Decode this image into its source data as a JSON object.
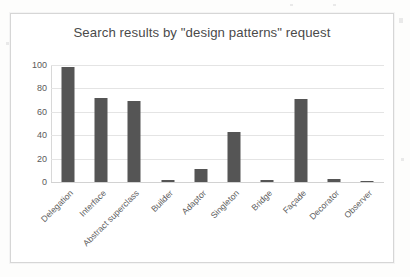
{
  "chart_data": {
    "type": "bar",
    "title": "Search results by \"design patterns\" request",
    "xlabel": "",
    "ylabel": "",
    "ylim": [
      0,
      100
    ],
    "yticks": [
      100,
      80,
      60,
      40,
      20,
      0
    ],
    "grid": true,
    "legend": "none",
    "bar_color": "#555555",
    "categories": [
      "Delegation",
      "Interface",
      "Abstract superclass",
      "Builder",
      "Adaptor",
      "Singleton",
      "Bridge",
      "Façade",
      "Decorator",
      "Observer"
    ],
    "values": [
      98,
      72,
      69,
      2,
      11,
      43,
      2,
      71,
      3,
      1
    ]
  },
  "axis": {
    "y_tick_labels": [
      "100",
      "80",
      "60",
      "40",
      "20",
      "0"
    ]
  }
}
